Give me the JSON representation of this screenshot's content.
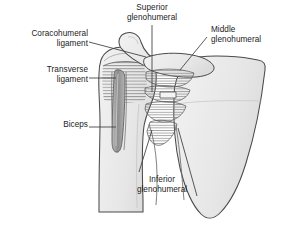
{
  "figure": {
    "background_color": "#ffffff",
    "text_color": "#1b1b1b",
    "bone_fill": "#eeeeee",
    "bone_stroke": "#4a4a4a",
    "tendon_fill": "#9a9a9a",
    "leader_line_color": "#3c3c3c"
  },
  "labels": {
    "coracohumeral": {
      "line1": "Coracohumeral",
      "line2": "ligament",
      "align": "right"
    },
    "transverse": {
      "line1": "Transverse",
      "line2": "ligament",
      "align": "right"
    },
    "biceps": {
      "line1": "Biceps",
      "align": "right"
    },
    "superior_glenohumeral": {
      "line1": "Superior",
      "line2": "glenohumeral",
      "align": "center"
    },
    "middle_glenohumeral": {
      "line1": "Middle",
      "line2": "glenohumeral",
      "align": "left"
    },
    "inferior_glenohumeral": {
      "line1": "Inferior",
      "line2": "glenohumeral",
      "align": "center"
    }
  },
  "structures": [
    {
      "name": "scapula-body",
      "label": "Scapula"
    },
    {
      "name": "humerus",
      "label": "Humerus"
    },
    {
      "name": "coracoid-process",
      "label": "Coracoid process"
    },
    {
      "name": "acromion",
      "label": "Acromion"
    },
    {
      "name": "biceps-tendon",
      "label": "Long head of biceps tendon"
    },
    {
      "name": "capsule-bands",
      "label": "Glenohumeral capsular ligaments"
    }
  ]
}
